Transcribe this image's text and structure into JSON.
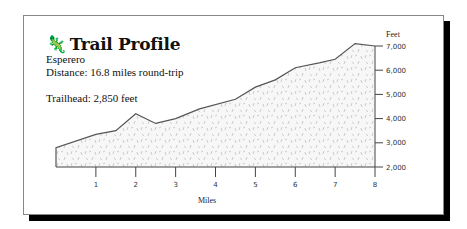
{
  "header": {
    "icon": "lizard-icon",
    "title": "Trail Profile",
    "trail_name": "Esperero",
    "distance": "Distance:  16.8 miles round-trip",
    "trailhead": "Trailhead: 2,850 feet"
  },
  "colors": {
    "line": "#555555",
    "fill": "#f4f4f4",
    "speckle": "#c8c8c8",
    "shadow": "#000000"
  },
  "chart_data": {
    "type": "area",
    "title": "Trail Profile",
    "subtitle": "Esperero",
    "xlabel": "Miles",
    "ylabel": "Feet",
    "x_ticks": [
      "1",
      "2",
      "3",
      "4",
      "5",
      "6",
      "7",
      "8"
    ],
    "y_ticks": [
      "2,000",
      "3,000",
      "4,000",
      "5,000",
      "6,000",
      "7,000"
    ],
    "xlim": [
      0,
      8
    ],
    "ylim": [
      2000,
      7000
    ],
    "grid": false,
    "y_axis_position": "right",
    "x": [
      0,
      1,
      1.5,
      2,
      2.5,
      3,
      3.6,
      4.5,
      5,
      5.5,
      6,
      6.6,
      7,
      7.5,
      8
    ],
    "values": [
      2800,
      3350,
      3500,
      4200,
      3800,
      4000,
      4400,
      4800,
      5300,
      5600,
      6100,
      6300,
      6450,
      7100,
      7000
    ]
  }
}
